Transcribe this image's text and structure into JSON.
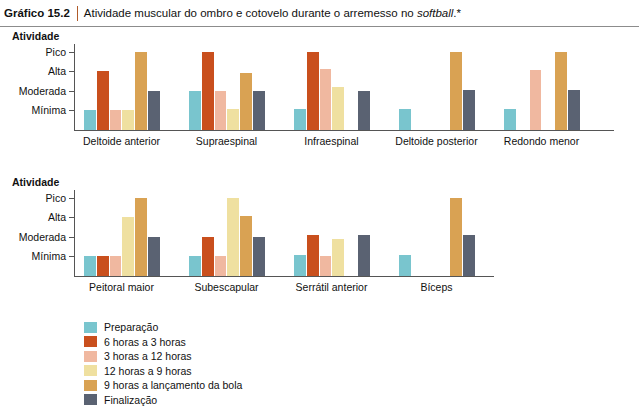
{
  "header": {
    "tag": "Gráfico 15.2",
    "title_before": "Atividade muscular do ombro e cotovelo durante o arremesso no ",
    "title_italic": "softball",
    "title_after": ".*"
  },
  "legend": {
    "items": [
      {
        "label": "Preparação",
        "color": "#79c5ce"
      },
      {
        "label": "6 horas a 3 horas",
        "color": "#c94f1d"
      },
      {
        "label": "3 horas a 12 horas",
        "color": "#f0b8a0"
      },
      {
        "label": "12 horas a 9 horas",
        "color": "#efe0a0"
      },
      {
        "label": "9 horas a lançamento da bola",
        "color": "#d9a253"
      },
      {
        "label": "Finalização",
        "color": "#5a6272"
      }
    ]
  },
  "chart_data": [
    {
      "type": "bar",
      "title": "",
      "ylabel": "Atividade",
      "xlabel": "",
      "yticklabels": [
        "Mínima",
        "Moderada",
        "Alta",
        "Pico"
      ],
      "ylim": [
        0,
        4.4
      ],
      "grid": false,
      "legend_position": "below",
      "categories": [
        "Deltoide anterior",
        "Supraespinal",
        "Infraespinal",
        "Deltoide posterior",
        "Redondo menor"
      ],
      "series": [
        {
          "name": "Preparação",
          "color": "#79c5ce",
          "values": [
            1.0,
            2.0,
            1.1,
            1.05,
            1.1
          ]
        },
        {
          "name": "6 horas a 3 horas",
          "color": "#c94f1d",
          "values": [
            3.0,
            4.0,
            4.0,
            0,
            0
          ]
        },
        {
          "name": "3 horas a 12 horas",
          "color": "#f0b8a0",
          "values": [
            1.0,
            2.0,
            3.1,
            0,
            3.05
          ]
        },
        {
          "name": "12 horas a 9 horas",
          "color": "#efe0a0",
          "values": [
            1.0,
            1.05,
            2.2,
            0,
            0
          ]
        },
        {
          "name": "9 horas a lançamento da bola",
          "color": "#d9a253",
          "values": [
            4.0,
            2.9,
            0,
            4.0,
            4.0
          ]
        },
        {
          "name": "Finalização",
          "color": "#5a6272",
          "values": [
            2.0,
            2.0,
            2.0,
            2.05,
            2.05
          ]
        }
      ]
    },
    {
      "type": "bar",
      "title": "",
      "ylabel": "Atividade",
      "xlabel": "",
      "yticklabels": [
        "Mínima",
        "Moderada",
        "Alta",
        "Pico"
      ],
      "ylim": [
        0,
        4.4
      ],
      "grid": false,
      "legend_position": "below",
      "categories": [
        "Peitoral maior",
        "Subescapular",
        "Serrátil anterior",
        "Bíceps"
      ],
      "series": [
        {
          "name": "Preparação",
          "color": "#79c5ce",
          "values": [
            1.0,
            1.0,
            1.1,
            1.1
          ]
        },
        {
          "name": "6 horas a 3 horas",
          "color": "#c94f1d",
          "values": [
            1.0,
            2.0,
            2.1,
            0
          ]
        },
        {
          "name": "3 horas a 12 horas",
          "color": "#f0b8a0",
          "values": [
            1.0,
            1.0,
            1.0,
            0
          ]
        },
        {
          "name": "12 horas a 9 horas",
          "color": "#efe0a0",
          "values": [
            3.0,
            4.0,
            1.9,
            0
          ]
        },
        {
          "name": "9 horas a lançamento da bola",
          "color": "#d9a253",
          "values": [
            4.0,
            3.05,
            0,
            4.0
          ]
        },
        {
          "name": "Finalização",
          "color": "#5a6272",
          "values": [
            2.0,
            2.0,
            2.1,
            2.1
          ]
        }
      ]
    }
  ]
}
